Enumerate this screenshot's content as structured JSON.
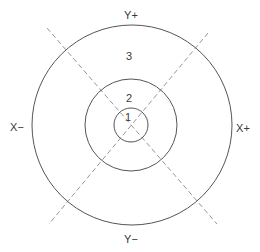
{
  "diagram": {
    "type": "concentric-zones",
    "center": {
      "x": 131,
      "y": 125
    },
    "circles": [
      {
        "id": "inner",
        "radius": 17,
        "zone_label": "1"
      },
      {
        "id": "middle",
        "radius": 46,
        "zone_label": "2"
      },
      {
        "id": "outer",
        "radius": 100,
        "zone_label": "3"
      }
    ],
    "axis_labels": {
      "top": "Y+",
      "bottom": "Y−",
      "left": "X−",
      "right": "X+"
    },
    "diagonals": [
      {
        "style": "dashed",
        "from": {
          "x": 47,
          "y": 28
        },
        "to": {
          "x": 217,
          "y": 224
        }
      },
      {
        "style": "dashed",
        "from": {
          "x": 208,
          "y": 33
        },
        "to": {
          "x": 49,
          "y": 224
        }
      }
    ],
    "colors": {
      "stroke": "#555555",
      "dash": "#8a8a8a",
      "text": "#3a3a3a"
    }
  }
}
